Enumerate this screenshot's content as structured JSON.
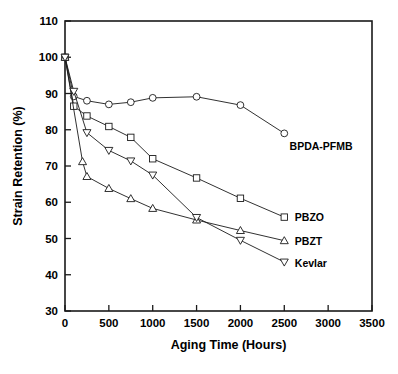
{
  "chart_data": {
    "type": "line",
    "title": "",
    "xlabel": "Aging Time (Hours)",
    "ylabel": "Strain Retention (%)",
    "xlim": [
      0,
      3500
    ],
    "ylim": [
      30,
      110
    ],
    "xticks": [
      0,
      500,
      1000,
      1500,
      2000,
      2500,
      3000,
      3500
    ],
    "yticks": [
      30,
      40,
      50,
      60,
      70,
      80,
      90,
      100,
      110
    ],
    "xtick_labels": [
      "0",
      "500",
      "1000",
      "1500",
      "2000",
      "2500",
      "3000",
      "3500"
    ],
    "ytick_labels": [
      "30",
      "40",
      "50",
      "60",
      "70",
      "80",
      "90",
      "100",
      "110"
    ],
    "grid": false,
    "legend_position": "right-inline-annotations",
    "series": [
      {
        "name": "BPDA-PFMB",
        "marker": "circle",
        "label_x": 2560,
        "label_y": 75.5,
        "x": [
          0,
          100,
          250,
          500,
          750,
          1000,
          1500,
          2000,
          2500
        ],
        "y": [
          100,
          89.2,
          88.0,
          87.0,
          87.6,
          88.8,
          89.1,
          86.8,
          79.0
        ]
      },
      {
        "name": "PBZO",
        "marker": "square",
        "label_x": 2620,
        "label_y": 55.8,
        "x": [
          0,
          100,
          250,
          500,
          750,
          1000,
          1500,
          2000,
          2500
        ],
        "y": [
          100,
          86.5,
          83.8,
          80.9,
          77.9,
          72.0,
          66.7,
          61.1,
          55.9
        ]
      },
      {
        "name": "PBZT",
        "marker": "triangle-up",
        "label_x": 2620,
        "label_y": 49.4,
        "x": [
          0,
          200,
          250,
          500,
          750,
          1000,
          1500,
          2000,
          2500
        ],
        "y": [
          100,
          71.2,
          67.1,
          63.8,
          61.0,
          58.3,
          55.1,
          52.2,
          49.4
        ]
      },
      {
        "name": "Kevlar",
        "marker": "triangle-down",
        "label_x": 2620,
        "label_y": 43.2,
        "x": [
          0,
          100,
          250,
          500,
          750,
          1000,
          1500,
          2000,
          2500
        ],
        "y": [
          100,
          90.6,
          79.2,
          74.3,
          71.4,
          67.5,
          55.8,
          49.5,
          43.5
        ]
      }
    ]
  }
}
